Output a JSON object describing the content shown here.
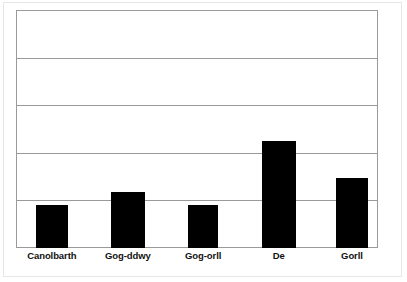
{
  "figure": {
    "background_color": "#ffffff",
    "frame_color": "#e7e7e7",
    "axis_color": "#9a9a9a",
    "bar_color": "#000000"
  },
  "chart_data": {
    "type": "bar",
    "title": "",
    "subtitle": "",
    "xlabel": "",
    "ylabel": "",
    "categories": [
      "Canolbarth",
      "Gog-ddwy",
      "Gog-orll",
      "De",
      "Gorll"
    ],
    "values": [
      0.9,
      1.18,
      0.9,
      2.25,
      1.47
    ],
    "ylim": [
      0,
      5
    ],
    "yticks": [
      0,
      1,
      2,
      3,
      4,
      5
    ],
    "ytick_labels": [
      "",
      "",
      "",
      "",
      "",
      ""
    ],
    "grid": true,
    "grid_axis": "y",
    "legend": false,
    "legend_position": "none",
    "series": [
      {
        "name": "",
        "values": [
          0.9,
          1.18,
          0.9,
          2.25,
          1.47
        ]
      }
    ],
    "annotations": []
  },
  "bars": [
    {
      "label": "Canolbarth",
      "value": 0.9,
      "left_pct": 5.5,
      "width_pct": 8.8,
      "height_pct": 18.0
    },
    {
      "label": "Gog-ddwy",
      "value": 1.18,
      "left_pct": 26.2,
      "width_pct": 9.4,
      "height_pct": 23.5
    },
    {
      "label": "Gog-orll",
      "value": 0.9,
      "left_pct": 47.5,
      "width_pct": 8.3,
      "height_pct": 18.0
    },
    {
      "label": "De",
      "value": 2.25,
      "left_pct": 67.9,
      "width_pct": 9.4,
      "height_pct": 45.0
    },
    {
      "label": "Gorll",
      "value": 1.47,
      "left_pct": 88.4,
      "width_pct": 8.8,
      "height_pct": 29.4
    }
  ],
  "gridlines": [
    {
      "value": 4,
      "top_pct": 20.0
    },
    {
      "value": 3,
      "top_pct": 40.0
    },
    {
      "value": 2,
      "top_pct": 60.0
    },
    {
      "value": 1,
      "top_pct": 80.0
    }
  ],
  "x_axis_labels": [
    {
      "text": "Canolbarth",
      "center_pct": 9.9
    },
    {
      "text": "Gog-ddwy",
      "center_pct": 30.9
    },
    {
      "text": "Gog-orll",
      "center_pct": 51.7
    },
    {
      "text": "De",
      "center_pct": 72.6
    },
    {
      "text": "Gorll",
      "center_pct": 92.8
    }
  ]
}
